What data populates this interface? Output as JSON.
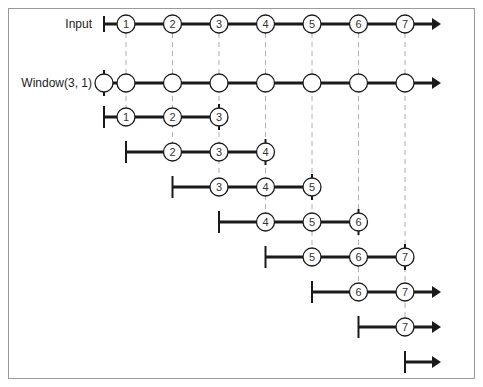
{
  "diagram": {
    "colors": {
      "line": "#1a1a1a",
      "dash": "#b0b0b0",
      "border": "#9a9a9a",
      "circle_fill": "#ffffff"
    },
    "labels": {
      "input": "Input",
      "window": "Window(3, 1)"
    },
    "input_row": {
      "items": [
        "1",
        "2",
        "3",
        "4",
        "5",
        "6",
        "7"
      ],
      "has_arrow": true
    },
    "window_row": {
      "empty_circles": 8,
      "has_arrow": true
    },
    "windows": [
      {
        "start_col": -1,
        "items": [
          "1",
          "2",
          "3"
        ],
        "closed": true
      },
      {
        "start_col": 0,
        "items": [
          "2",
          "3",
          "4"
        ],
        "closed": true
      },
      {
        "start_col": 1,
        "items": [
          "3",
          "4",
          "5"
        ],
        "closed": true
      },
      {
        "start_col": 2,
        "items": [
          "4",
          "5",
          "6"
        ],
        "closed": true
      },
      {
        "start_col": 3,
        "items": [
          "5",
          "6",
          "7"
        ],
        "closed": true
      },
      {
        "start_col": 4,
        "items": [
          "6",
          "7"
        ],
        "closed": false
      },
      {
        "start_col": 5,
        "items": [
          "7"
        ],
        "closed": false
      },
      {
        "start_col": 6,
        "items": [],
        "closed": false
      }
    ]
  }
}
